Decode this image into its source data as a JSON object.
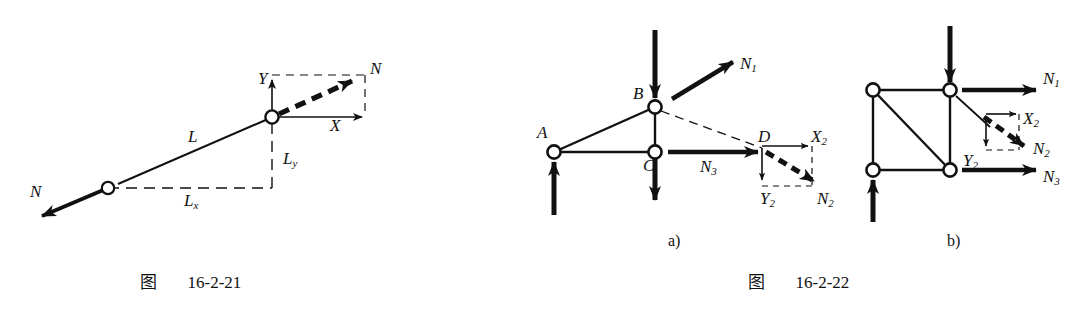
{
  "page": {
    "width": 1089,
    "height": 312,
    "background": "#ffffff",
    "ink": "#111111"
  },
  "figures": [
    {
      "id": "fig-16-2-21",
      "caption_cjk": "图",
      "caption_number": "16-2-21",
      "description": "Single truss member inclined, force N acting along member axis, resolved into X and Y components with length projections L, Lx, Ly",
      "joints": [
        {
          "name": "lower-joint",
          "x": 108,
          "y": 188
        },
        {
          "name": "upper-joint",
          "x": 272,
          "y": 117
        }
      ],
      "labels": [
        {
          "name": "force-n-lower",
          "text": "N",
          "sub": "",
          "x": 30,
          "y": 183
        },
        {
          "name": "force-n-upper",
          "text": "N",
          "sub": "",
          "x": 370,
          "y": 60
        },
        {
          "name": "member-length-l",
          "text": "L",
          "sub": "",
          "x": 188,
          "y": 128
        },
        {
          "name": "projection-lx",
          "text": "L",
          "sub": "x",
          "x": 184,
          "y": 192
        },
        {
          "name": "projection-ly",
          "text": "L",
          "sub": "y",
          "x": 283,
          "y": 150
        },
        {
          "name": "axis-x",
          "text": "X",
          "sub": "",
          "x": 330,
          "y": 117
        },
        {
          "name": "axis-y",
          "text": "Y",
          "sub": "",
          "x": 258,
          "y": 70
        }
      ]
    },
    {
      "id": "fig-16-2-22",
      "caption_cjk": "图",
      "caption_number": "16-2-22",
      "subfigures": [
        {
          "id": "subfig-a",
          "label": "a)",
          "label_x": 668,
          "label_y": 232,
          "description": "Triangular truss cut, joints A B C D, member forces N1 N2 N3, force N2 resolved into X2 and Y2",
          "joints": [
            {
              "name": "joint-a",
              "x": 554,
              "y": 152
            },
            {
              "name": "joint-b",
              "x": 655,
              "y": 107
            },
            {
              "name": "joint-c",
              "x": 655,
              "y": 152
            }
          ],
          "labels": [
            {
              "name": "joint-label-a",
              "text": "A",
              "sub": "",
              "x": 537,
              "y": 124
            },
            {
              "name": "joint-label-b",
              "text": "B",
              "sub": "",
              "x": 633,
              "y": 85
            },
            {
              "name": "joint-label-c",
              "text": "C",
              "sub": "",
              "x": 643,
              "y": 157
            },
            {
              "name": "joint-label-d",
              "text": "D",
              "sub": "",
              "x": 758,
              "y": 128
            },
            {
              "name": "force-n1",
              "text": "N",
              "sub": "1",
              "x": 740,
              "y": 55
            },
            {
              "name": "force-n2",
              "text": "N",
              "sub": "2",
              "x": 817,
              "y": 190
            },
            {
              "name": "force-n3",
              "text": "N",
              "sub": "3",
              "x": 700,
              "y": 158
            },
            {
              "name": "component-x2",
              "text": "X",
              "sub": "2",
              "x": 811,
              "y": 128
            },
            {
              "name": "component-y2",
              "text": "Y",
              "sub": "2",
              "x": 760,
              "y": 190
            }
          ]
        },
        {
          "id": "subfig-b",
          "label": "b)",
          "label_x": 947,
          "label_y": 232,
          "description": "Rectangular truss panel with diagonal, member forces N1 N2 N3, force N2 resolved into X2 and Y2",
          "joints": [
            {
              "name": "joint-top-left",
              "x": 873,
              "y": 90
            },
            {
              "name": "joint-top-right",
              "x": 950,
              "y": 90
            },
            {
              "name": "joint-bottom-left",
              "x": 873,
              "y": 170
            },
            {
              "name": "joint-bottom-right",
              "x": 950,
              "y": 170
            }
          ],
          "labels": [
            {
              "name": "force-n1",
              "text": "N",
              "sub": "1",
              "x": 1043,
              "y": 70
            },
            {
              "name": "force-n2",
              "text": "N",
              "sub": "2",
              "x": 1033,
              "y": 140
            },
            {
              "name": "force-n3",
              "text": "N",
              "sub": "3",
              "x": 1043,
              "y": 168
            },
            {
              "name": "component-x2",
              "text": "X",
              "sub": "2",
              "x": 1023,
              "y": 110
            },
            {
              "name": "component-y2",
              "text": "Y",
              "sub": "2",
              "x": 963,
              "y": 152
            }
          ]
        }
      ]
    }
  ],
  "captions": [
    {
      "name": "caption-left",
      "cjk": "图",
      "number": "16-2-21",
      "x": 140,
      "y": 268
    },
    {
      "name": "caption-right",
      "cjk": "图",
      "number": "16-2-22",
      "x": 748,
      "y": 268
    }
  ]
}
